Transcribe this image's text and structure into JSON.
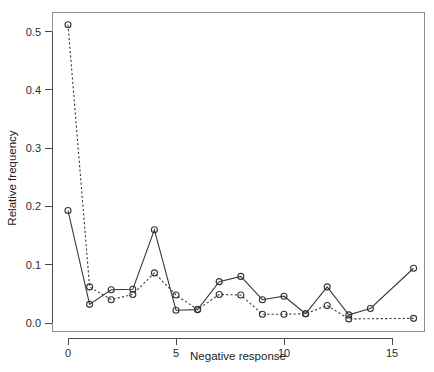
{
  "chart_data": {
    "type": "line",
    "title": "",
    "xlabel": "Negative response",
    "ylabel": "Relative frequency",
    "xlim": [
      -0.6,
      16.6
    ],
    "ylim": [
      -0.012,
      0.525
    ],
    "grid": false,
    "legend": "none",
    "xticks": [
      0,
      5,
      10,
      15
    ],
    "xtick_labels": [
      "0",
      "5",
      "10",
      "15"
    ],
    "yticks": [
      0.0,
      0.1,
      0.2,
      0.3,
      0.4,
      0.5
    ],
    "ytick_labels": [
      "0.0",
      "0.1",
      "0.2",
      "0.3",
      "0.4",
      "0.5"
    ],
    "marker": "open-circle",
    "series": [
      {
        "name": "observed",
        "style": "solid",
        "x": [
          0,
          1,
          2,
          3,
          4,
          5,
          6,
          7,
          8,
          9,
          10,
          11,
          12,
          13,
          14,
          16
        ],
        "values": [
          0.193,
          0.032,
          0.057,
          0.058,
          0.16,
          0.022,
          0.023,
          0.071,
          0.08,
          0.04,
          0.046,
          0.016,
          0.062,
          0.014,
          0.025,
          0.094
        ]
      },
      {
        "name": "fitted",
        "style": "dashed",
        "x": [
          0,
          1,
          2,
          3,
          4,
          5,
          6,
          7,
          8,
          9,
          10,
          11,
          12,
          13,
          16
        ],
        "values": [
          0.512,
          0.062,
          0.04,
          0.049,
          0.086,
          0.048,
          0.023,
          0.049,
          0.048,
          0.015,
          0.015,
          0.016,
          0.03,
          0.007,
          0.008
        ]
      }
    ]
  },
  "axis": {
    "x_title": "Negative response",
    "y_title": "Relative frequency"
  },
  "colors": {
    "line": "#3a3a3a",
    "axis": "#4a4a4a",
    "frame": "#8e8e8e",
    "text": "#2b2b2b",
    "background": "#ffffff"
  }
}
